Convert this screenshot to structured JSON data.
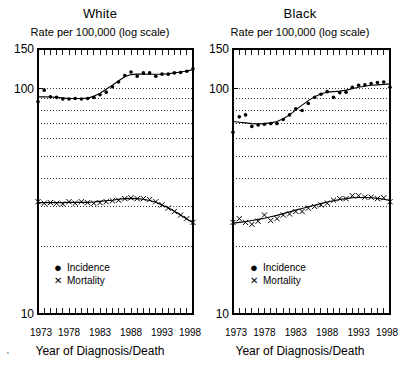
{
  "figure": {
    "xlabel": "Year of Diagnosis/Death",
    "axis_note": "Rate per 100,000 (log scale)",
    "corner_mark": "'"
  },
  "legend": {
    "incidence_label": "Incidence",
    "mortality_label": "Mortality",
    "incidence_marker": "●",
    "mortality_marker": "✕"
  },
  "axes": {
    "ytick_labels": [
      "150",
      "100",
      "10"
    ],
    "ytick_values": [
      150,
      100,
      10
    ],
    "xtick_labels": [
      "1973",
      "1978",
      "1983",
      "1988",
      "1993",
      "1998"
    ],
    "xtick_values": [
      1973,
      1978,
      1983,
      1988,
      1993,
      1998
    ],
    "gridline_values": [
      100,
      90,
      80,
      70,
      60,
      50,
      40,
      30,
      20
    ],
    "ylim": [
      10,
      150
    ],
    "xlim": [
      1973,
      1998
    ],
    "scale": "log"
  },
  "chart_data": [
    {
      "type": "scatter",
      "title": "White",
      "xlabel": "Year of Diagnosis/Death",
      "ylabel": "Rate per 100,000 (log scale)",
      "ylim": [
        10,
        150
      ],
      "xlim": [
        1973,
        1998
      ],
      "yscale": "log",
      "grid": true,
      "legend": "lower left",
      "x": [
        1973,
        1974,
        1975,
        1976,
        1977,
        1978,
        1979,
        1980,
        1981,
        1982,
        1983,
        1984,
        1985,
        1986,
        1987,
        1988,
        1989,
        1990,
        1991,
        1992,
        1993,
        1994,
        1995,
        1996,
        1997,
        1998
      ],
      "series": [
        {
          "name": "Incidence",
          "marker": "dot",
          "values": [
            87.5,
            98.5,
            92.0,
            91.5,
            90.0,
            90.0,
            90.5,
            90.0,
            90.5,
            91.5,
            94.0,
            96.5,
            102.0,
            107.0,
            114.5,
            118.5,
            113.5,
            117.5,
            117.5,
            113.5,
            116.0,
            116.0,
            117.5,
            118.0,
            119.5,
            122.5
          ],
          "fitted": [
            92.0,
            92.0,
            91.8,
            91.5,
            91.0,
            90.5,
            90.5,
            90.5,
            90.8,
            92.5,
            95.5,
            99.5,
            103.5,
            108.5,
            113.0,
            115.5,
            116.0,
            116.0,
            115.8,
            115.8,
            116.0,
            116.5,
            117.5,
            118.5,
            119.8,
            121.5
          ]
        },
        {
          "name": "Mortality",
          "marker": "x",
          "values": [
            31.5,
            31.0,
            31.2,
            31.0,
            30.8,
            31.5,
            31.0,
            31.5,
            31.2,
            31.0,
            31.2,
            31.5,
            31.8,
            32.0,
            32.5,
            32.8,
            32.5,
            32.5,
            32.2,
            31.5,
            30.5,
            29.5,
            28.5,
            27.5,
            26.5,
            25.5
          ],
          "fitted": [
            31.2,
            31.2,
            31.2,
            31.2,
            31.2,
            31.3,
            31.3,
            31.3,
            31.3,
            31.4,
            31.6,
            31.8,
            32.0,
            32.3,
            32.5,
            32.6,
            32.5,
            32.3,
            31.9,
            31.3,
            30.5,
            29.6,
            28.6,
            27.5,
            26.4,
            25.4
          ]
        }
      ]
    },
    {
      "type": "scatter",
      "title": "Black",
      "xlabel": "Year of Diagnosis/Death",
      "ylabel": "Rate per 100,000 (log scale)",
      "ylim": [
        10,
        150
      ],
      "xlim": [
        1973,
        1998
      ],
      "yscale": "log",
      "grid": true,
      "legend": "lower left",
      "x": [
        1973,
        1974,
        1975,
        1976,
        1977,
        1978,
        1979,
        1980,
        1981,
        1982,
        1983,
        1984,
        1985,
        1986,
        1987,
        1988,
        1989,
        1990,
        1991,
        1992,
        1993,
        1994,
        1995,
        1996,
        1997,
        1998
      ],
      "series": [
        {
          "name": "Incidence",
          "marker": "dot",
          "values": [
            64.0,
            75.0,
            76.5,
            68.0,
            69.0,
            69.5,
            70.0,
            70.0,
            73.0,
            76.5,
            81.5,
            80.0,
            86.0,
            91.5,
            94.5,
            97.0,
            91.5,
            96.0,
            96.5,
            101.5,
            103.5,
            104.0,
            105.5,
            106.5,
            107.0,
            101.5
          ],
          "fitted": [
            71.5,
            71.0,
            70.5,
            70.0,
            69.8,
            70.0,
            70.5,
            71.5,
            73.5,
            76.5,
            80.5,
            84.5,
            88.5,
            92.0,
            95.0,
            96.5,
            97.0,
            97.5,
            98.5,
            100.0,
            101.5,
            102.5,
            103.5,
            104.0,
            104.5,
            105.0
          ]
        },
        {
          "name": "Mortality",
          "marker": "x",
          "values": [
            25.5,
            26.5,
            25.5,
            25.0,
            25.8,
            27.5,
            26.0,
            26.5,
            27.5,
            27.8,
            28.5,
            28.5,
            29.5,
            30.0,
            30.5,
            31.0,
            32.0,
            32.5,
            32.5,
            33.5,
            33.5,
            33.0,
            33.0,
            32.5,
            32.8,
            31.5
          ],
          "fitted": [
            25.3,
            25.5,
            25.7,
            26.0,
            26.3,
            26.6,
            27.0,
            27.4,
            27.9,
            28.4,
            28.9,
            29.4,
            29.9,
            30.4,
            30.9,
            31.4,
            31.8,
            32.2,
            32.5,
            32.8,
            32.9,
            32.9,
            32.8,
            32.6,
            32.3,
            31.9
          ]
        }
      ]
    }
  ]
}
